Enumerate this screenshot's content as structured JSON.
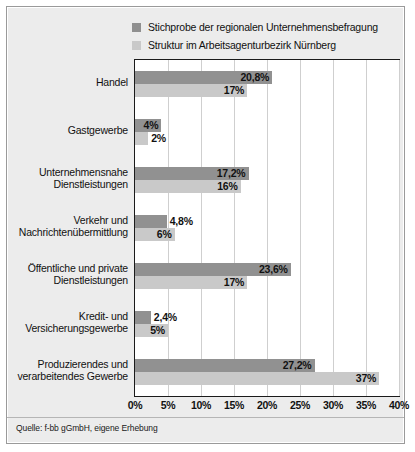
{
  "legend": {
    "items": [
      {
        "label": "Stichprobe der regionalen Unternehmensbefragung",
        "color": "#8f8f8f",
        "swatch_name": "legend-swatch-dark"
      },
      {
        "label": "Struktur im Arbeitsagenturbezirk Nürnberg",
        "color": "#c9c9c9",
        "swatch_name": "legend-swatch-light"
      }
    ]
  },
  "source": {
    "text": "Quelle: f-bb gGmbH, eigene Erhebung"
  },
  "chart_data": {
    "type": "bar",
    "orientation": "horizontal",
    "title": "",
    "xlabel": "",
    "ylabel": "",
    "xlim": [
      0,
      40
    ],
    "xticks": [
      "0%",
      "5%",
      "10%",
      "15%",
      "20%",
      "25%",
      "30%",
      "35%",
      "40%"
    ],
    "xtick_values": [
      0,
      5,
      10,
      15,
      20,
      25,
      30,
      35,
      40
    ],
    "grid": true,
    "legend_position": "top",
    "categories": [
      "Handel",
      "Gastgewerbe",
      "Unternehmensnahe Dienstleistungen",
      "Verkehr und Nachrichtenübermittlung",
      "Öffentliche und private Dienstleistungen",
      "Kredit- und Versicherungsgewerbe",
      "Produzierendes und verarbeitendes Gewerbe"
    ],
    "category_lines": [
      [
        "Handel"
      ],
      [
        "Gastgewerbe"
      ],
      [
        "Unternehmensnahe",
        "Dienstleistungen"
      ],
      [
        "Verkehr und",
        "Nachrichtenübermittlung"
      ],
      [
        "Öffentliche und private",
        "Dienstleistungen"
      ],
      [
        "Kredit- und",
        "Versicherungsgewerbe"
      ],
      [
        "Produzierendes und",
        "verarbeitendes Gewerbe"
      ]
    ],
    "series": [
      {
        "name": "Stichprobe der regionalen Unternehmensbefragung",
        "color": "#919191",
        "values": [
          20.8,
          4.0,
          17.2,
          4.8,
          23.6,
          2.4,
          27.2
        ],
        "labels": [
          "20,8%",
          "4%",
          "17,2%",
          "4,8%",
          "23,6%",
          "2,4%",
          "27,2%"
        ],
        "label_placement": [
          "inside",
          "inside",
          "inside",
          "outside",
          "inside",
          "outside",
          "inside"
        ]
      },
      {
        "name": "Struktur im Arbeitsagenturbezirk Nürnberg",
        "color": "#c9c9c9",
        "values": [
          17.0,
          2.0,
          16.0,
          6.0,
          17.0,
          5.0,
          37.0
        ],
        "labels": [
          "17%",
          "2%",
          "16%",
          "6%",
          "17%",
          "5%",
          "37%"
        ],
        "label_placement": [
          "inside",
          "outside",
          "inside",
          "inside",
          "inside",
          "inside",
          "inside"
        ]
      }
    ]
  }
}
